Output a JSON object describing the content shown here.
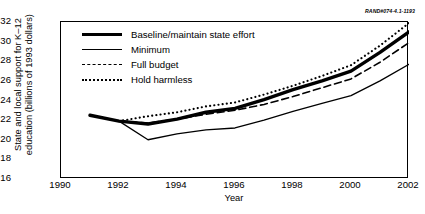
{
  "source_id": "RAND#074-4.1-1193",
  "chart_data": {
    "type": "line",
    "title": "",
    "xlabel": "Year",
    "ylabel": "State and local support for K–12 education (billions of 1993 dollars)",
    "ylabel_line1": "State and local support for K–12",
    "ylabel_line2": "education (billions of 1993 dollars)",
    "xlim": [
      1990,
      2002
    ],
    "ylim": [
      16,
      32
    ],
    "xticks": [
      1990,
      1992,
      1994,
      1996,
      1998,
      2000,
      2002
    ],
    "yticks": [
      16,
      18,
      20,
      22,
      24,
      26,
      28,
      30,
      32
    ],
    "grid": false,
    "legend_position": "upper-left-inside",
    "series": [
      {
        "name": "Baseline/maintain state effort",
        "style": "thick-solid",
        "color": "#000000",
        "x": [
          1991,
          1992,
          1993,
          1994,
          1995,
          1996,
          1997,
          1998,
          1999,
          2000,
          2001,
          2002
        ],
        "values": [
          22.5,
          21.9,
          21.6,
          22.1,
          22.8,
          23.2,
          24.1,
          25.1,
          26.0,
          27.0,
          28.9,
          31.0
        ]
      },
      {
        "name": "Minimum",
        "style": "thin-solid",
        "color": "#000000",
        "x": [
          1991,
          1992,
          1993,
          1994,
          1995,
          1996,
          1997,
          1998,
          1999,
          2000,
          2001,
          2002
        ],
        "values": [
          22.5,
          21.9,
          20.0,
          20.6,
          21.0,
          21.2,
          22.0,
          22.9,
          23.7,
          24.5,
          26.0,
          27.7
        ]
      },
      {
        "name": "Full budget",
        "style": "dashed",
        "color": "#000000",
        "x": [
          1992,
          1993,
          1994,
          1995,
          1996,
          1997,
          1998,
          1999,
          2000,
          2001,
          2002
        ],
        "values": [
          21.9,
          21.7,
          22.1,
          22.6,
          23.0,
          23.6,
          24.4,
          25.3,
          26.2,
          27.9,
          29.9
        ]
      },
      {
        "name": "Hold harmless",
        "style": "dotted",
        "color": "#000000",
        "x": [
          1992,
          1993,
          1994,
          1995,
          1996,
          1997,
          1998,
          1999,
          2000,
          2001,
          2002
        ],
        "values": [
          21.9,
          22.4,
          22.8,
          23.4,
          23.8,
          24.6,
          25.5,
          26.5,
          27.6,
          29.6,
          31.9
        ]
      }
    ]
  }
}
